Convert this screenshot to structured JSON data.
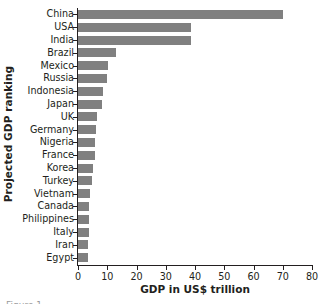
{
  "chart_data": {
    "type": "bar",
    "orientation": "horizontal",
    "title": "",
    "xlabel": "GDP in US$ trillion",
    "ylabel": "Projected GDP ranking",
    "xlim": [
      0,
      80
    ],
    "xticks": [
      0,
      10,
      20,
      30,
      40,
      50,
      60,
      70,
      80
    ],
    "grid": false,
    "legend": false,
    "bar_color": "#808080",
    "axis_color": "#231f20",
    "categories": [
      "China",
      "USA",
      "India",
      "Brazil",
      "Mexico",
      "Russia",
      "Indonesia",
      "Japan",
      "UK",
      "Germany",
      "Nigeria",
      "France",
      "Korea",
      "Turkey",
      "Vietnam",
      "Canada",
      "Philippines",
      "Italy",
      "Iran",
      "Egypt"
    ],
    "values": [
      70,
      38.5,
      38.5,
      13,
      10.2,
      9.8,
      8.5,
      8.2,
      6.5,
      6.2,
      5.8,
      5.8,
      5,
      4.8,
      4.2,
      3.8,
      3.8,
      3.6,
      3.4,
      3.4
    ]
  },
  "caption": {
    "sliver_text": "Figure 1"
  }
}
